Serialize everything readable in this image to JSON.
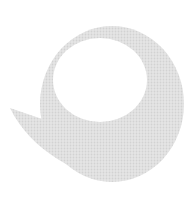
{
  "image": {
    "description": "Light gray halftone swirl / crescent logo mark on white background",
    "colors": {
      "background": "#ffffff",
      "mark": "#e2e2e2",
      "mark_dot": "#d4d4d4"
    }
  }
}
